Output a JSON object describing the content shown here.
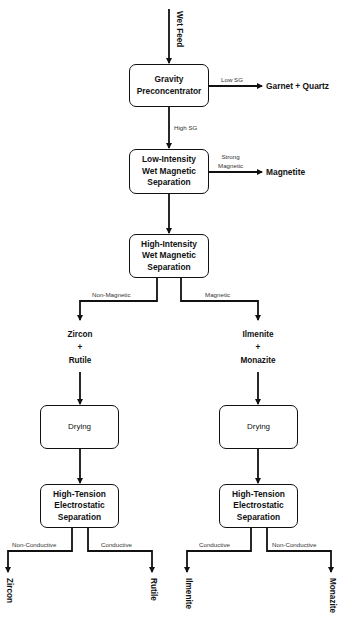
{
  "diagram": {
    "type": "process-flowchart",
    "input": "Wet Feed",
    "nodes": {
      "gravity": "Gravity\nPreconcentrator",
      "liwms": "Low-Intensity\nWet Magnetic\nSeparation",
      "hiwms": "High-Intensity\nWet Magnetic\nSeparation",
      "drying_left": "Drying",
      "drying_right": "Drying",
      "hte_left": "High-Tension\nElectrostatic\nSeparation",
      "hte_right": "High-Tension\nElectrostatic\nSeparation"
    },
    "edge_labels": {
      "low_sg": "Low SG",
      "high_sg": "High SG",
      "strong_magnetic": "Strong\nMagnetic",
      "non_magnetic": "Non-Magnetic",
      "magnetic": "Magnetic",
      "left_non_conductive": "Non-Conductive",
      "left_conductive": "Conductive",
      "right_conductive": "Conductive",
      "right_non_conductive": "Non-Conductive"
    },
    "intermediates": {
      "left": "Zircon\n+\nRutile",
      "right": "Ilmenite\n+\nMonazite"
    },
    "products": {
      "garnet_quartz": "Garnet + Quartz",
      "magnetite": "Magnetite",
      "zircon": "Zircon",
      "rutile": "Rutile",
      "ilmenite": "Ilmenite",
      "monazite": "Monazite"
    },
    "colors": {
      "line": "#111111",
      "box_border": "#111111",
      "label": "#333333",
      "background": "#ffffff"
    }
  }
}
